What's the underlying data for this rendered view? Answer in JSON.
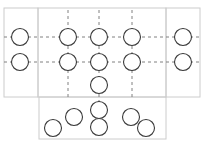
{
  "diagram": {
    "title": "",
    "width": 203,
    "height": 151,
    "background": "#ffffff",
    "node_stroke": "#3a3a3a",
    "node_fill": "none",
    "node_radius": 8.5,
    "node_stroke_width": 1.1,
    "frame_stroke": "#cccccc",
    "frame_stroke_width": 1,
    "frame_fill": "none",
    "grid_stroke": "#808080",
    "grid_stroke_width": 1,
    "grid_dash": "3,3",
    "frames": [
      {
        "id": "left-frame",
        "label": "left region",
        "x": 4,
        "y": 8,
        "w": 34,
        "h": 89
      },
      {
        "id": "middle-frame",
        "label": "middle region",
        "x": 38,
        "y": 8,
        "w": 128,
        "h": 89
      },
      {
        "id": "right-frame",
        "label": "right region",
        "x": 166,
        "y": 8,
        "w": 34,
        "h": 89
      },
      {
        "id": "bottom-frame",
        "label": "bottom region",
        "x": 39,
        "y": 97,
        "w": 127,
        "h": 42
      }
    ],
    "grid_lines_horizontal": [
      {
        "id": "h-row-1",
        "y": 37,
        "x1": 4,
        "x2": 200
      },
      {
        "id": "h-row-2",
        "y": 62,
        "x1": 4,
        "x2": 200
      }
    ],
    "grid_lines_vertical": [
      {
        "id": "v-col-1",
        "x": 68,
        "y1": 10,
        "y2": 97
      },
      {
        "id": "v-col-2",
        "x": 99,
        "y1": 10,
        "y2": 113
      },
      {
        "id": "v-col-3",
        "x": 132,
        "y1": 10,
        "y2": 97
      }
    ],
    "nodes": [
      {
        "id": "node-left-1",
        "group": "left",
        "cx": 20,
        "cy": 37,
        "r": 8.5
      },
      {
        "id": "node-left-2",
        "group": "left",
        "cx": 20,
        "cy": 62,
        "r": 8.5
      },
      {
        "id": "node-grid-r1c1",
        "group": "grid",
        "cx": 68,
        "cy": 37,
        "r": 8.5
      },
      {
        "id": "node-grid-r1c2",
        "group": "grid",
        "cx": 99,
        "cy": 37,
        "r": 8.5
      },
      {
        "id": "node-grid-r1c3",
        "group": "grid",
        "cx": 132,
        "cy": 37,
        "r": 8.5
      },
      {
        "id": "node-grid-r2c1",
        "group": "grid",
        "cx": 68,
        "cy": 62,
        "r": 8.5
      },
      {
        "id": "node-grid-r2c2",
        "group": "grid",
        "cx": 99,
        "cy": 62,
        "r": 8.5
      },
      {
        "id": "node-grid-r2c3",
        "group": "grid",
        "cx": 132,
        "cy": 62,
        "r": 8.5
      },
      {
        "id": "node-center-stack-1",
        "group": "center-stack",
        "cx": 99,
        "cy": 85,
        "r": 8.5
      },
      {
        "id": "node-center-stack-2",
        "group": "center-stack",
        "cx": 99,
        "cy": 110,
        "r": 8.5
      },
      {
        "id": "node-center-stack-3",
        "group": "center-stack",
        "cx": 99,
        "cy": 127,
        "r": 8.5
      },
      {
        "id": "node-right-1",
        "group": "right",
        "cx": 183,
        "cy": 37,
        "r": 8.5
      },
      {
        "id": "node-right-2",
        "group": "right",
        "cx": 183,
        "cy": 62,
        "r": 8.5
      },
      {
        "id": "node-bottom-1",
        "group": "bottom",
        "cx": 53,
        "cy": 128,
        "r": 8.5
      },
      {
        "id": "node-bottom-2",
        "group": "bottom",
        "cx": 74,
        "cy": 117,
        "r": 8.5
      },
      {
        "id": "node-bottom-3",
        "group": "bottom",
        "cx": 131,
        "cy": 117,
        "r": 8.5
      },
      {
        "id": "node-bottom-4",
        "group": "bottom",
        "cx": 146,
        "cy": 128,
        "r": 8.5
      }
    ]
  }
}
